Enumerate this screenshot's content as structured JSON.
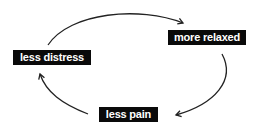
{
  "diagram": {
    "type": "cycle",
    "nodes": [
      {
        "id": "more-relaxed",
        "label": "more relaxed"
      },
      {
        "id": "less-pain",
        "label": "less pain"
      },
      {
        "id": "less-distress",
        "label": "less distress"
      }
    ],
    "edges": [
      {
        "from": "less-distress",
        "to": "more-relaxed"
      },
      {
        "from": "more-relaxed",
        "to": "less-pain"
      },
      {
        "from": "less-pain",
        "to": "less-distress"
      }
    ],
    "colors": {
      "node_bg": "#0a0a0a",
      "node_text": "#ffffff",
      "arrow": "#222222"
    }
  }
}
